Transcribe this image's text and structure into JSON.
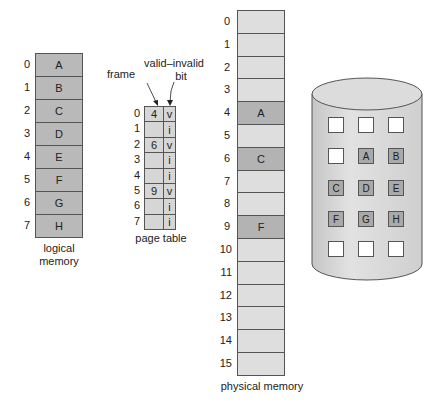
{
  "logical_memory": {
    "label_line1": "logical",
    "label_line2": "memory",
    "rows": [
      {
        "index": "0",
        "page": "A"
      },
      {
        "index": "1",
        "page": "B"
      },
      {
        "index": "2",
        "page": "C"
      },
      {
        "index": "3",
        "page": "D"
      },
      {
        "index": "4",
        "page": "E"
      },
      {
        "index": "5",
        "page": "F"
      },
      {
        "index": "6",
        "page": "G"
      },
      {
        "index": "7",
        "page": "H"
      }
    ]
  },
  "page_table": {
    "label": "page table",
    "frame_header": "frame",
    "bit_header_line1": "valid–invalid",
    "bit_header_line2": "bit",
    "rows": [
      {
        "index": "0",
        "frame": "4",
        "bit": "v"
      },
      {
        "index": "1",
        "frame": "",
        "bit": "i"
      },
      {
        "index": "2",
        "frame": "6",
        "bit": "v"
      },
      {
        "index": "3",
        "frame": "",
        "bit": "i"
      },
      {
        "index": "4",
        "frame": "",
        "bit": "i"
      },
      {
        "index": "5",
        "frame": "9",
        "bit": "v"
      },
      {
        "index": "6",
        "frame": "",
        "bit": "i"
      },
      {
        "index": "7",
        "frame": "",
        "bit": "i"
      }
    ]
  },
  "physical_memory": {
    "label": "physical memory",
    "frames": [
      {
        "index": "0",
        "content": ""
      },
      {
        "index": "1",
        "content": ""
      },
      {
        "index": "2",
        "content": ""
      },
      {
        "index": "3",
        "content": ""
      },
      {
        "index": "4",
        "content": "A"
      },
      {
        "index": "5",
        "content": ""
      },
      {
        "index": "6",
        "content": "C"
      },
      {
        "index": "7",
        "content": ""
      },
      {
        "index": "8",
        "content": ""
      },
      {
        "index": "9",
        "content": "F"
      },
      {
        "index": "10",
        "content": ""
      },
      {
        "index": "11",
        "content": ""
      },
      {
        "index": "12",
        "content": ""
      },
      {
        "index": "13",
        "content": ""
      },
      {
        "index": "14",
        "content": ""
      },
      {
        "index": "15",
        "content": ""
      }
    ]
  },
  "backing_store": {
    "grid": [
      [
        "",
        "",
        ""
      ],
      [
        "",
        "A",
        "B"
      ],
      [
        "C",
        "D",
        "E"
      ],
      [
        "F",
        "G",
        "H"
      ],
      [
        "",
        "",
        ""
      ]
    ]
  },
  "colors": {
    "logical_fill": "#b9b9b9",
    "physical_fill": "#dedede",
    "physical_used_fill": "#b3b3b3",
    "page_table_fill": "#d6d6d6",
    "disk_fill": "#d0d0d0",
    "outline": "#555555"
  }
}
